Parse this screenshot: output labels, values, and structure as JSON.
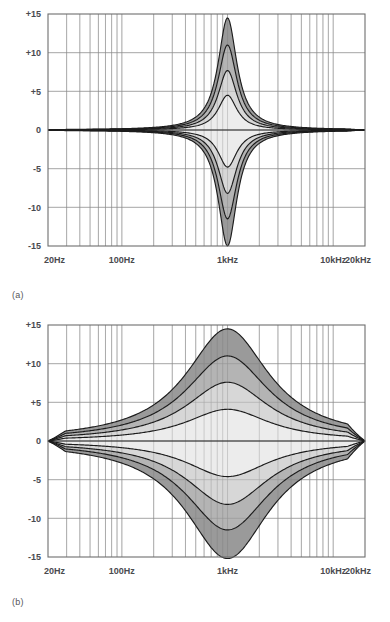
{
  "figures": [
    {
      "id": "a",
      "panel_label": "(a)",
      "chart_data": {
        "type": "line",
        "title": "",
        "subtitle": "",
        "xlabel": "",
        "ylabel": "",
        "scale": "log",
        "xlim": [
          20,
          20000
        ],
        "ylim": [
          -15,
          15
        ],
        "grid": true,
        "legend": false,
        "legend_position": "none",
        "xticks": [
          20,
          100,
          1000,
          10000,
          20000
        ],
        "xticklabels": [
          "20Hz",
          "100Hz",
          "1kHz",
          "10kHz",
          "20kHz"
        ],
        "yticks": [
          15,
          10,
          5,
          0,
          -5,
          -10,
          -15
        ],
        "yticklabels": [
          "+15",
          "+10",
          "+5",
          "0",
          "-5",
          "-10",
          "-15"
        ],
        "center_frequency_hz": 1000,
        "q_factor": 2.0,
        "bandwidth_octaves": 0.72,
        "series": [
          {
            "name": "boost +14.5 dB",
            "gain_db": 14.5
          },
          {
            "name": "boost +11 dB",
            "gain_db": 11.0
          },
          {
            "name": "boost +7.7 dB",
            "gain_db": 7.7
          },
          {
            "name": "boost +4.5 dB",
            "gain_db": 4.5
          },
          {
            "name": "flat 0 dB",
            "gain_db": 0.0
          },
          {
            "name": "cut -4.8 dB",
            "gain_db": -4.8
          },
          {
            "name": "cut -8.2 dB",
            "gain_db": -8.2
          },
          {
            "name": "cut -11.5 dB",
            "gain_db": -11.5
          },
          {
            "name": "cut -15 dB",
            "gain_db": -15.0
          }
        ],
        "bands": [
          {
            "from_db": 14.5,
            "to_db": 11.0,
            "fill": "#9a9a9a"
          },
          {
            "from_db": 11.0,
            "to_db": 7.7,
            "fill": "#b4b4b4"
          },
          {
            "from_db": 7.7,
            "to_db": 4.5,
            "fill": "#d7d7d7"
          },
          {
            "from_db": 4.5,
            "to_db": 0.0,
            "fill": "#ececec"
          },
          {
            "from_db": 0.0,
            "to_db": -4.8,
            "fill": "#ececec"
          },
          {
            "from_db": -4.8,
            "to_db": -8.2,
            "fill": "#d7d7d7"
          },
          {
            "from_db": -8.2,
            "to_db": -11.5,
            "fill": "#b4b4b4"
          },
          {
            "from_db": -11.5,
            "to_db": -15.0,
            "fill": "#9a9a9a"
          }
        ]
      }
    },
    {
      "id": "b",
      "panel_label": "(b)",
      "chart_data": {
        "type": "line",
        "title": "",
        "subtitle": "",
        "xlabel": "",
        "ylabel": "",
        "scale": "log",
        "xlim": [
          20,
          20000
        ],
        "ylim": [
          -15,
          15
        ],
        "grid": true,
        "legend": false,
        "legend_position": "none",
        "xticks": [
          20,
          100,
          1000,
          10000,
          20000
        ],
        "xticklabels": [
          "20Hz",
          "100Hz",
          "1kHz",
          "10kHz",
          "20kHz"
        ],
        "yticks": [
          15,
          10,
          5,
          0,
          -5,
          -10,
          -15
        ],
        "yticklabels": [
          "+15",
          "+10",
          "+5",
          "0",
          "-5",
          "-10",
          "-15"
        ],
        "center_frequency_hz": 1000,
        "q_factor": 0.42,
        "bandwidth_octaves": 3.2,
        "series": [
          {
            "name": "boost +14.5 dB",
            "gain_db": 14.5
          },
          {
            "name": "boost +11 dB",
            "gain_db": 11.0
          },
          {
            "name": "boost +7.6 dB",
            "gain_db": 7.6
          },
          {
            "name": "boost +4.1 dB",
            "gain_db": 4.1
          },
          {
            "name": "flat 0 dB",
            "gain_db": 0.0
          },
          {
            "name": "cut -4.6 dB",
            "gain_db": -4.6
          },
          {
            "name": "cut -8.2 dB",
            "gain_db": -8.2
          },
          {
            "name": "cut -11.5 dB",
            "gain_db": -11.5
          },
          {
            "name": "cut -15.2 dB",
            "gain_db": -15.2
          }
        ],
        "bands": [
          {
            "from_db": 14.5,
            "to_db": 11.0,
            "fill": "#9a9a9a"
          },
          {
            "from_db": 11.0,
            "to_db": 7.6,
            "fill": "#b4b4b4"
          },
          {
            "from_db": 7.6,
            "to_db": 4.1,
            "fill": "#d7d7d7"
          },
          {
            "from_db": 4.1,
            "to_db": 0.0,
            "fill": "#ececec"
          },
          {
            "from_db": 0.0,
            "to_db": -4.6,
            "fill": "#ececec"
          },
          {
            "from_db": -4.6,
            "to_db": -8.2,
            "fill": "#d7d7d7"
          },
          {
            "from_db": -8.2,
            "to_db": -11.5,
            "fill": "#b4b4b4"
          },
          {
            "from_db": -11.5,
            "to_db": -15.2,
            "fill": "#9a9a9a"
          }
        ]
      }
    }
  ],
  "style": {
    "grid_color": "#9b9b9b",
    "axis_color": "#6e6e6e",
    "curve_color": "#1c1c1c",
    "label_color": "#4a4a4f",
    "background": "#ffffff"
  }
}
